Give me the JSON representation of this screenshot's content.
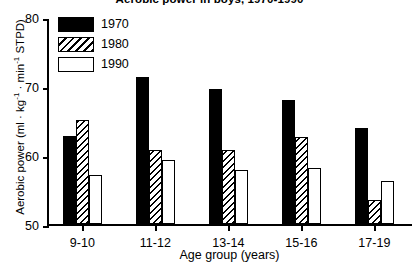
{
  "chart_data": {
    "type": "bar",
    "title": "Aerobic power in boys, 1970-1990",
    "xlabel": "Age group (years)",
    "ylabel": "Aerobic power (ml · kg⁻¹ · min⁻¹ STPD)",
    "categories": [
      "9-10",
      "11-12",
      "13-14",
      "15-16",
      "17-19"
    ],
    "series": [
      {
        "name": "1970",
        "fill": "solid-black",
        "values": [
          62.8,
          71.3,
          69.6,
          68.0,
          63.9
        ]
      },
      {
        "name": "1980",
        "fill": "diagonal-hatch",
        "values": [
          65.1,
          60.7,
          60.7,
          62.6,
          53.5
        ]
      },
      {
        "name": "1990",
        "fill": "white",
        "values": [
          57.1,
          59.3,
          57.8,
          58.1,
          56.3
        ]
      }
    ],
    "ylim": [
      50,
      80
    ],
    "yticks": [
      50,
      60,
      70,
      80
    ],
    "ytick_labels": [
      "50",
      "60",
      "70",
      "80"
    ],
    "grid": false,
    "legend_position": "top-left",
    "colors": {
      "series_1970": "#000000",
      "series_1980": "#000000",
      "series_1990": "#ffffff",
      "axis": "#000000",
      "background": "#ffffff"
    }
  },
  "ylabel_parts": {
    "prefix": "Aerobic power (ml · kg",
    "sup1": "-1",
    "mid": " · min",
    "sup2": "-1",
    "suffix": " STPD)"
  }
}
